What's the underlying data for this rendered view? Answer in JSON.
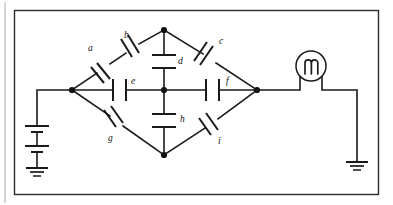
{
  "diagram": {
    "type": "electrical-schematic",
    "stroke_color": "#1a1a1a",
    "frame_color": "#2b2b2b",
    "background": "#ffffff"
  },
  "components": {
    "capacitors": [
      {
        "id": "a",
        "label": "a",
        "branch": "left-node to b (upper-left arm)",
        "orientation": "diagonal-up-right",
        "label_x": 88,
        "label_y": 51
      },
      {
        "id": "b",
        "label": "b",
        "branch": "a to top-node (upper-left arm)",
        "orientation": "diagonal-up-right",
        "label_x": 124,
        "label_y": 38
      },
      {
        "id": "c",
        "label": "c",
        "branch": "top-node to right-node (upper-right arm)",
        "orientation": "diagonal-down-right",
        "label_x": 219,
        "label_y": 44
      },
      {
        "id": "d",
        "label": "d",
        "branch": "top-node to center-node (vertical)",
        "orientation": "horizontal-plates",
        "label_x": 178,
        "label_y": 64
      },
      {
        "id": "e",
        "label": "e",
        "branch": "left-node to center-node (horizontal)",
        "orientation": "vertical-plates",
        "label_x": 131,
        "label_y": 84
      },
      {
        "id": "f",
        "label": "f",
        "branch": "center-node to right-node (horizontal)",
        "orientation": "vertical-plates",
        "label_x": 226,
        "label_y": 84
      },
      {
        "id": "g",
        "label": "g",
        "branch": "left-node to bottom-node (lower-left arm)",
        "orientation": "diagonal-down-right",
        "label_x": 108,
        "label_y": 141
      },
      {
        "id": "h",
        "label": "h",
        "branch": "center-node to bottom-node (vertical)",
        "orientation": "horizontal-plates",
        "label_x": 180,
        "label_y": 122
      },
      {
        "id": "i",
        "label": "i",
        "branch": "bottom-node to right-node (lower-right arm)",
        "orientation": "diagonal-up-right",
        "label_x": 218,
        "label_y": 144
      }
    ],
    "battery": {
      "name": "battery",
      "position": "left side",
      "cells": 2
    },
    "meter": {
      "name": "meter",
      "glyph": "M",
      "position": "right side, inline with top wire"
    },
    "grounds": [
      {
        "name": "ground-left",
        "position": "bottom of battery"
      },
      {
        "name": "ground-right",
        "position": "bottom right of meter branch"
      }
    ],
    "nodes": [
      {
        "name": "node-left",
        "x": 72,
        "y": 90
      },
      {
        "name": "node-top",
        "x": 164,
        "y": 30
      },
      {
        "name": "node-center",
        "x": 164,
        "y": 90
      },
      {
        "name": "node-bottom",
        "x": 164,
        "y": 155
      },
      {
        "name": "node-right",
        "x": 257,
        "y": 90
      }
    ]
  }
}
